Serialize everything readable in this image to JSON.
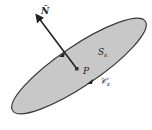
{
  "diagram": {
    "normal_label": "N̂",
    "surface_label": "S",
    "surface_subscript": "ε",
    "point_label": "P",
    "curve_label": "𝒞",
    "curve_subscript": "ε",
    "colors": {
      "surface_fill": "#c8c8c8",
      "outline": "#3a3a3a",
      "arrow": "#222222",
      "background": "#ffffff"
    }
  }
}
